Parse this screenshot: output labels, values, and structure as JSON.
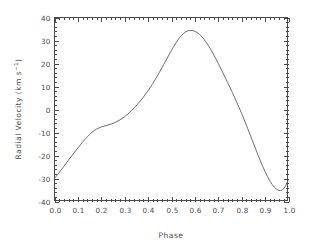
{
  "chart_data": {
    "type": "line",
    "title": "",
    "xlabel": "Phase",
    "ylabel": "Radial Velocity (km s−1)",
    "ylabel_parts": {
      "main": "Radial Velocity (km s",
      "exponent": "−1",
      "tail": ")"
    },
    "xlim": [
      0.0,
      1.0
    ],
    "ylim": [
      -40,
      40
    ],
    "xticks": [
      0.0,
      0.1,
      0.2,
      0.3,
      0.4,
      0.5,
      0.6,
      0.7,
      0.8,
      0.9,
      1.0
    ],
    "xticklabels": [
      "0.0",
      "0.1",
      "0.2",
      "0.3",
      "0.4",
      "0.5",
      "0.6",
      "0.7",
      "0.8",
      "0.9",
      "1.0"
    ],
    "yticks": [
      -40,
      -30,
      -20,
      -10,
      0,
      10,
      20,
      30,
      40
    ],
    "yticklabels": [
      "-40",
      "-30",
      "-20",
      "-10",
      "0",
      "10",
      "20",
      "30",
      "40"
    ],
    "minor_ticks_per_interval": 5,
    "grid": false,
    "legend": null,
    "line_color": "#5c5c5c",
    "axis_color": "#4a4a4a",
    "background_color": "#ffffff",
    "series": [
      {
        "name": "radial velocity curve",
        "x": [
          0.0,
          0.02,
          0.04,
          0.06,
          0.08,
          0.1,
          0.12,
          0.14,
          0.16,
          0.18,
          0.2,
          0.22,
          0.24,
          0.26,
          0.28,
          0.3,
          0.32,
          0.34,
          0.36,
          0.38,
          0.4,
          0.42,
          0.44,
          0.46,
          0.48,
          0.5,
          0.52,
          0.54,
          0.56,
          0.58,
          0.6,
          0.62,
          0.64,
          0.66,
          0.68,
          0.7,
          0.72,
          0.74,
          0.76,
          0.78,
          0.8,
          0.82,
          0.84,
          0.86,
          0.88,
          0.9,
          0.92,
          0.94,
          0.96,
          0.98,
          1.0
        ],
        "y": [
          -30.0,
          -27.4,
          -24.7,
          -22.0,
          -19.3,
          -16.7,
          -14.2,
          -11.9,
          -9.9,
          -8.5,
          -7.6,
          -7.0,
          -6.4,
          -5.6,
          -4.5,
          -3.1,
          -1.4,
          0.6,
          2.9,
          5.4,
          8.2,
          11.3,
          14.7,
          18.3,
          22.0,
          25.7,
          29.1,
          31.9,
          33.7,
          34.4,
          34.0,
          32.6,
          30.4,
          27.4,
          23.9,
          20.0,
          15.9,
          11.7,
          7.4,
          2.9,
          -1.8,
          -6.8,
          -12.0,
          -17.3,
          -22.4,
          -27.0,
          -31.0,
          -33.8,
          -35.2,
          -34.4,
          -30.5
        ]
      }
    ],
    "annotations": {
      "maximum": {
        "phase": 0.575,
        "value": 34.4
      },
      "minimum": {
        "phase": 0.955,
        "value": -35.2
      },
      "shoulder": {
        "phase": 0.22,
        "value": -7.0
      }
    }
  },
  "figure": {
    "width": 312,
    "height": 246,
    "plot_area": {
      "left": 54,
      "top": 17,
      "right": 288,
      "bottom": 201
    }
  }
}
